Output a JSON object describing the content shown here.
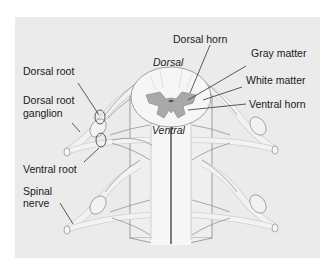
{
  "diagram": {
    "colors": {
      "panel_bg": "#ebebeb",
      "page_bg": "#ffffff",
      "gray_matter": "#a9a9a9",
      "white_matter": "#f4f4f4",
      "nerve_fill": "#f0f0f0",
      "outline": "#7a7a7a",
      "leader_line": "#333333"
    },
    "inner_labels": {
      "dorsal": "Dorsal",
      "ventral": "Ventral"
    },
    "labels_left": [
      {
        "id": "dorsal-root",
        "text": "Dorsal root"
      },
      {
        "id": "dorsal-root-ganglion-1",
        "text": "Dorsal root"
      },
      {
        "id": "dorsal-root-ganglion-2",
        "text": "ganglion"
      },
      {
        "id": "ventral-root",
        "text": "Ventral root"
      },
      {
        "id": "spinal-nerve-1",
        "text": "Spinal"
      },
      {
        "id": "spinal-nerve-2",
        "text": "nerve"
      }
    ],
    "labels_right": [
      {
        "id": "dorsal-horn",
        "text": "Dorsal horn"
      },
      {
        "id": "gray-matter",
        "text": "Gray matter"
      },
      {
        "id": "white-matter",
        "text": "White matter"
      },
      {
        "id": "ventral-horn",
        "text": "Ventral horn"
      }
    ]
  }
}
